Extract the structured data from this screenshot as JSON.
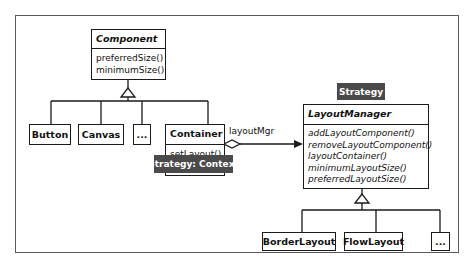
{
  "diagram": {
    "type": "UML class diagram",
    "classes": {
      "component": {
        "name": "Component",
        "operations": [
          "preferredSize()",
          "minimumSize()"
        ]
      },
      "button": {
        "name": "Button"
      },
      "canvas": {
        "name": "Canvas"
      },
      "component_more": {
        "name": "..."
      },
      "container": {
        "name": "Container",
        "operations": [
          "setLayout()",
          "layout()"
        ]
      },
      "layout_manager": {
        "name": "LayoutManager",
        "operations": [
          "addLayoutComponent()",
          "removeLayoutComponent()",
          "layoutContainer()",
          "minimumLayoutSize()",
          "preferredLayoutSize()"
        ]
      },
      "border_layout": {
        "name": "BorderLayout"
      },
      "flow_layout": {
        "name": "FlowLayout"
      },
      "layout_more": {
        "name": "..."
      }
    },
    "association": {
      "role": "layoutMgr"
    },
    "tags": {
      "context": "Strategy: Context",
      "strategy": "Strategy"
    },
    "colors": {
      "tag_bg": "#4a4a4a",
      "line": "#1a1a1a"
    }
  }
}
